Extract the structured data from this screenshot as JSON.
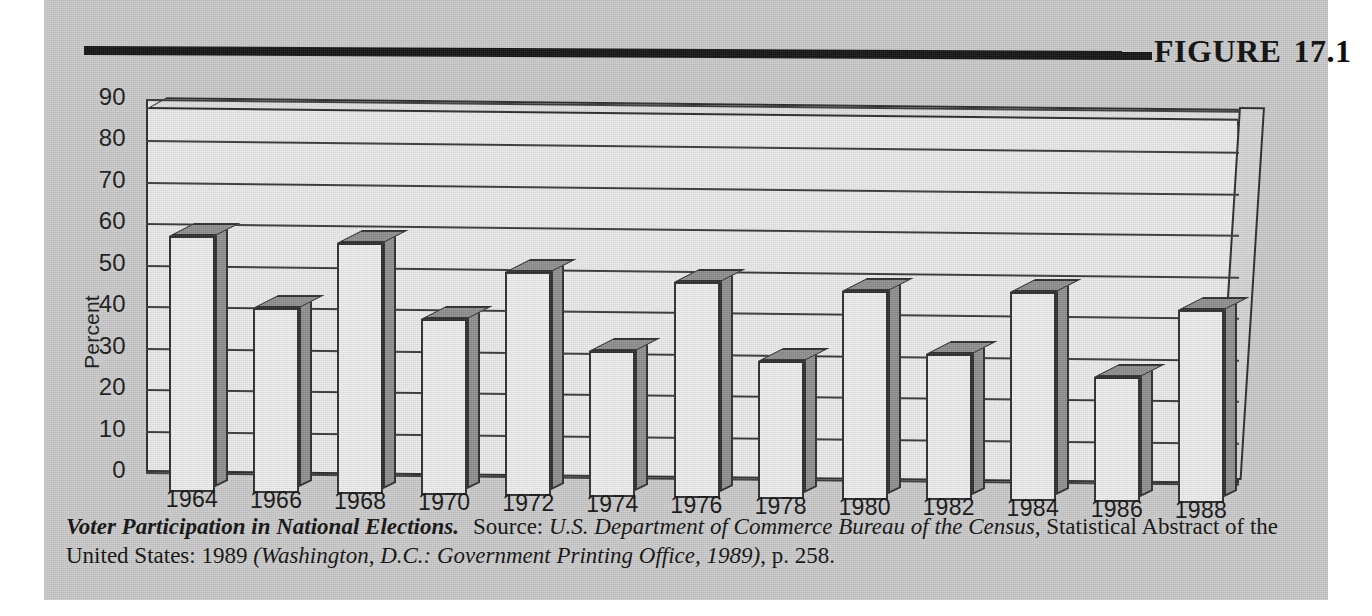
{
  "figure": {
    "label": "FIGURE",
    "number": "17.1"
  },
  "caption": {
    "title": "Voter Participation in National Elections.",
    "source_label": "Source:",
    "source_italic_1": "U.S. Department of Commerce Bureau of the Census,",
    "source_roman_1": "Statistical Abstract of the United States: 1989",
    "source_italic_2": "(Washington, D.C.: Government Printing Office, 1989)",
    "source_roman_2": ", p. 258."
  },
  "colors": {
    "page_background": "#c9c9c9",
    "plot_background": "#e9e9e9",
    "bar_face": "#ececec",
    "bar_shade": "#8e8e8e",
    "ink": "#1a1a1a",
    "rule": "#141414"
  },
  "chart_data": {
    "type": "bar",
    "title": "Voter Participation in National Elections",
    "xlabel": "",
    "ylabel": "Percent",
    "ylim": [
      0,
      90
    ],
    "ytick_step": 10,
    "yticks": [
      "90",
      "80",
      "70",
      "60",
      "50",
      "40",
      "30",
      "20",
      "10",
      "0"
    ],
    "grid": true,
    "legend": "none",
    "style": "3d-column",
    "categories": [
      "1964",
      "1966",
      "1968",
      "1970",
      "1972",
      "1974",
      "1976",
      "1978",
      "1980",
      "1982",
      "1984",
      "1986",
      "1988"
    ],
    "values": [
      61.9,
      44.6,
      60.7,
      42.5,
      54.0,
      35.2,
      52.0,
      33.3,
      50.4,
      35.4,
      50.4,
      30.3,
      46.5
    ]
  }
}
